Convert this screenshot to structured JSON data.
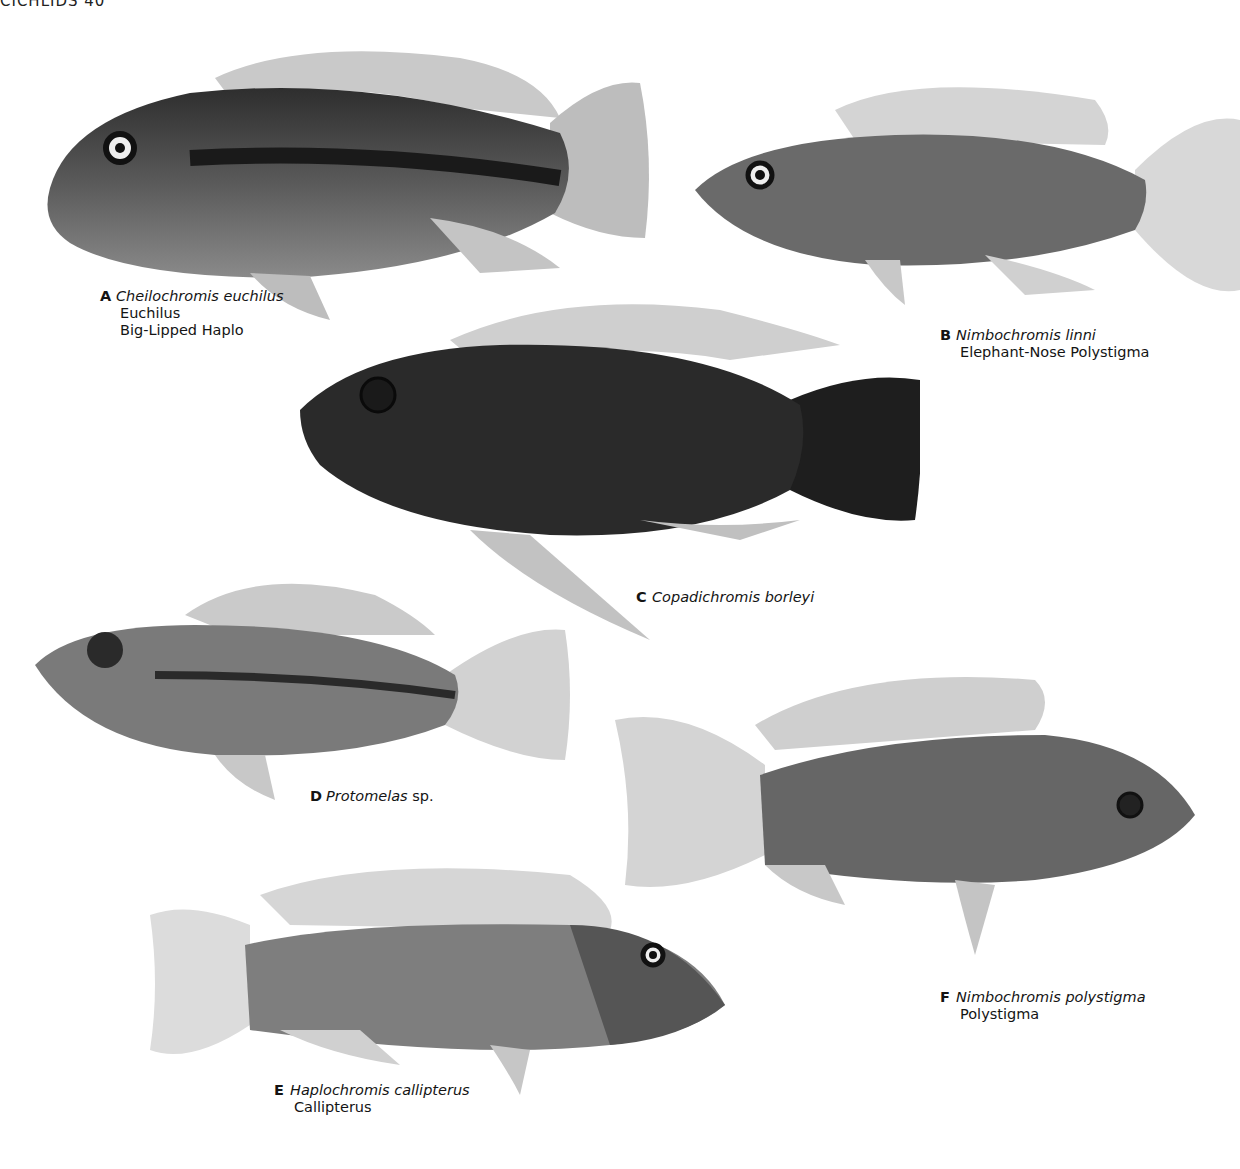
{
  "header": {
    "text": "CICHLIDS 40"
  },
  "plates": [
    {
      "letter": "A",
      "scientific": "Cheilochromis euchilus",
      "common": [
        "Euchilus",
        "Big-Lipped Haplo"
      ]
    },
    {
      "letter": "B",
      "scientific": "Nimbochromis linni",
      "common": [
        "Elephant-Nose Polystigma"
      ]
    },
    {
      "letter": "C",
      "scientific": "Copadichromis borleyi",
      "common": []
    },
    {
      "letter": "D",
      "scientific": "Protomelas",
      "suffix": " sp.",
      "common": []
    },
    {
      "letter": "E",
      "scientific": "Haplochromis callipterus",
      "common": [
        "Callipterus"
      ]
    },
    {
      "letter": "F",
      "scientific": "Nimbochromis polystigma",
      "common": [
        "Polystigma"
      ]
    }
  ]
}
